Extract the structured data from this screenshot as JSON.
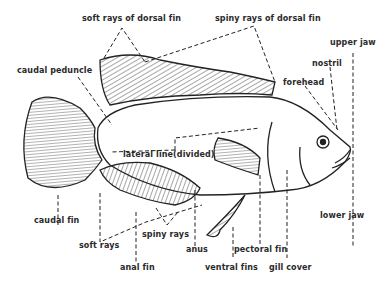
{
  "diagram": {
    "labels": {
      "soft_rays_dorsal": "soft rays of dorsal fin",
      "spiny_rays_dorsal": "spiny rays of dorsal fin",
      "upper_jaw": "upper jaw",
      "nostril": "nostril",
      "forehead": "forehead",
      "caudal_peduncle": "caudal peduncle",
      "lateral_line": "lateral line(divided)",
      "caudal_fin": "caudal fin",
      "soft_rays": "soft rays",
      "spiny_rays": "spiny rays",
      "anus": "anus",
      "anal_fin": "anal fin",
      "ventral_fins": "ventral fins",
      "pectoral_fin": "pectoral fin",
      "gill_cover": "gill cover",
      "lower_jaw": "lower jaw"
    },
    "colors": {
      "ink": "#222222",
      "background": "#ffffff"
    }
  }
}
